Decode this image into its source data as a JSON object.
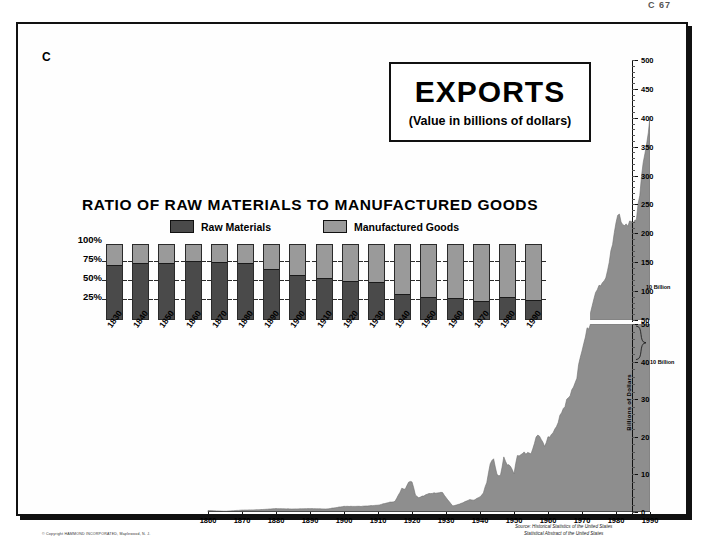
{
  "page": {
    "number": "C 67",
    "plate_letter": "C"
  },
  "title": {
    "main": "EXPORTS",
    "sub": "(Value in billions of dollars)"
  },
  "ratio_panel": {
    "title": "RATIO OF RAW MATERIALS TO MANUFACTURED GOODS",
    "legend": [
      {
        "label": "Raw Materials",
        "color": "#4a4a4a"
      },
      {
        "label": "Manufactured Goods",
        "color": "#9a9a9a"
      }
    ],
    "y_ticks": [
      "100%",
      "75%",
      "50%",
      "25%"
    ]
  },
  "annotations": {
    "bracket_top": "10 Billion",
    "bracket_bottom": "10 Billion",
    "y_axis_label": "Billions of Dollars"
  },
  "source": {
    "line1": "Source:  Historical Statistics of the United States",
    "line2": "Statistical Abstract of the United States"
  },
  "copyright": "© Copyright HAMMOND INCORPORATED, Maplewood, N. J.",
  "chart_data": {
    "type": "area",
    "title": "EXPORTS (Value in billions of dollars)",
    "xlabel": "",
    "ylabel": "Billions of Dollars",
    "grid": false,
    "legend_position": "top-center",
    "axes": {
      "lower_panel": {
        "ylim": [
          0,
          50
        ],
        "yticks": [
          0,
          10,
          20,
          30,
          40,
          50
        ]
      },
      "upper_panel": {
        "ylim": [
          50,
          500
        ],
        "yticks": [
          50,
          100,
          150,
          200,
          250,
          300,
          350,
          400,
          450,
          500
        ]
      },
      "xlim": [
        1860,
        1990
      ],
      "xticks": [
        1860,
        1870,
        1880,
        1890,
        1900,
        1910,
        1920,
        1930,
        1940,
        1950,
        1960,
        1970,
        1980,
        1990
      ]
    },
    "series": [
      {
        "name": "Total exports (billions of dollars)",
        "x": [
          1860,
          1865,
          1870,
          1875,
          1880,
          1885,
          1890,
          1895,
          1900,
          1905,
          1910,
          1913,
          1915,
          1917,
          1918,
          1919,
          1920,
          1921,
          1922,
          1925,
          1929,
          1930,
          1932,
          1934,
          1937,
          1938,
          1940,
          1941,
          1942,
          1943,
          1944,
          1945,
          1946,
          1947,
          1948,
          1949,
          1950,
          1951,
          1952,
          1953,
          1955,
          1957,
          1959,
          1960,
          1962,
          1964,
          1966,
          1968,
          1970,
          1972,
          1974,
          1975,
          1977,
          1979,
          1980,
          1981,
          1982,
          1984,
          1986,
          1988,
          1990
        ],
        "values": [
          0.4,
          0.2,
          0.5,
          0.6,
          0.9,
          0.8,
          0.9,
          0.8,
          1.5,
          1.5,
          1.8,
          2.5,
          2.8,
          6.2,
          6.1,
          7.9,
          8.2,
          4.5,
          3.8,
          4.9,
          5.2,
          3.8,
          1.6,
          2.1,
          3.3,
          3.1,
          4.0,
          5.1,
          8.0,
          12.8,
          14.3,
          9.8,
          9.7,
          14.4,
          12.7,
          12.1,
          10.3,
          15.0,
          15.2,
          15.8,
          15.5,
          20.9,
          17.6,
          19.6,
          21.7,
          26.5,
          30.4,
          34.1,
          43.2,
          49.8,
          98.5,
          107.7,
          121.2,
          181.8,
          220.7,
          233.7,
          212.3,
          217.9,
          223.4,
          320.3,
          393.6
        ]
      }
    ],
    "ratio_chart": {
      "type": "bar",
      "stacked": true,
      "title": "RATIO OF RAW MATERIALS TO MANUFACTURED GOODS",
      "ylabel": "",
      "ylim": [
        0,
        100
      ],
      "categories": [
        "1830",
        "1840",
        "1850",
        "1860",
        "1870",
        "1880",
        "1890",
        "1900",
        "1910",
        "1920",
        "1930",
        "1940",
        "1950",
        "1960",
        "1970",
        "1980",
        "1990"
      ],
      "series": [
        {
          "name": "Raw Materials",
          "color": "#4a4a4a",
          "values": [
            70,
            73,
            72,
            75,
            74,
            73,
            65,
            57,
            52,
            49,
            47,
            32,
            28,
            26,
            23,
            27,
            24
          ]
        },
        {
          "name": "Manufactured Goods",
          "color": "#9a9a9a",
          "values": [
            30,
            27,
            28,
            25,
            26,
            27,
            35,
            43,
            48,
            51,
            53,
            68,
            72,
            74,
            77,
            73,
            76
          ]
        }
      ]
    }
  }
}
